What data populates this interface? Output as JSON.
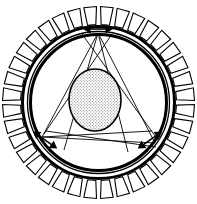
{
  "figure": {
    "background_color": "#ffffff",
    "line_color": "#000000",
    "canvas": {
      "width": 197,
      "height": 204
    }
  },
  "geometry": {
    "center": {
      "x": 98.5,
      "y": 102.5
    },
    "outer_tooth_tip_radius": 96,
    "outer_tooth_root_radius": 78,
    "stator_outer_ring_radius": 76,
    "stator_inner_ring_radius": 71,
    "rotor_circle_radius": 68,
    "tooth_count": 36,
    "tooth_angular_width_deg": 7.6,
    "core_ellipse": {
      "cx": 95,
      "cy": 100,
      "rx": 26,
      "ry": 31,
      "fill_pattern": "stipple-dots",
      "fill_color": "#cfcfcf",
      "stroke_color": "#000000"
    }
  },
  "arrows": {
    "label": "double-headed radial force arrows",
    "count": 3,
    "color": "#000000",
    "items": [
      {
        "name": "arrow-top",
        "angle_deg": 90,
        "anchor": {
          "x": 98,
          "y": 29
        },
        "length": 30,
        "rotation_deg": 0
      },
      {
        "name": "arrow-bottom-left",
        "angle_deg": 210,
        "anchor": {
          "x": 45,
          "y": 140
        },
        "length": 30,
        "rotation_deg": 35
      },
      {
        "name": "arrow-bottom-right",
        "angle_deg": 330,
        "anchor": {
          "x": 150,
          "y": 140
        },
        "length": 30,
        "rotation_deg": -35
      }
    ]
  },
  "measurement_lines": {
    "label": "thin connecting chord and crossing lines",
    "stroke_width": 0.9,
    "vertices": [
      {
        "name": "vertex-top",
        "x": 98,
        "y": 33
      },
      {
        "name": "vertex-bottom-left",
        "x": 42,
        "y": 137
      },
      {
        "name": "vertex-bottom-right",
        "x": 155,
        "y": 143
      }
    ],
    "chords": [
      {
        "from": "vertex-top",
        "to": "vertex-bottom-left"
      },
      {
        "from": "vertex-top",
        "to": "vertex-bottom-right"
      },
      {
        "from": "vertex-bottom-left",
        "to": "vertex-bottom-right"
      }
    ],
    "crossing_lines": [
      {
        "from": {
          "x": 82,
          "y": 34
        },
        "to": {
          "x": 158,
          "y": 140
        }
      },
      {
        "from": {
          "x": 112,
          "y": 34
        },
        "to": {
          "x": 44,
          "y": 134
        }
      },
      {
        "from": {
          "x": 98,
          "y": 33
        },
        "to": {
          "x": 128,
          "y": 152
        }
      },
      {
        "from": {
          "x": 98,
          "y": 33
        },
        "to": {
          "x": 64,
          "y": 150
        }
      },
      {
        "from": {
          "x": 42,
          "y": 137
        },
        "to": {
          "x": 152,
          "y": 131
        }
      },
      {
        "from": {
          "x": 46,
          "y": 131
        },
        "to": {
          "x": 156,
          "y": 147
        }
      }
    ]
  }
}
